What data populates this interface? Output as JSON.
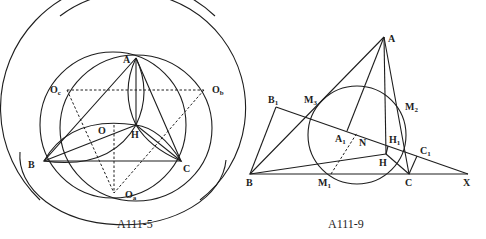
{
  "figures": [
    {
      "id": "left",
      "caption": "A111-5",
      "labels": {
        "A": "A",
        "B": "B",
        "C": "C",
        "H": "H",
        "O": "O",
        "Oa": "O",
        "Oa_sub": "a",
        "Ob": "O",
        "Ob_sub": "b",
        "Oc": "O",
        "Oc_sub": "c"
      }
    },
    {
      "id": "right",
      "caption": "A111-9",
      "labels": {
        "A": "A",
        "B": "B",
        "C": "C",
        "H": "H",
        "N": "N",
        "X": "X",
        "A1": "A",
        "A1_sub": "1",
        "B1": "B",
        "B1_sub": "1",
        "C1": "C",
        "C1_sub": "1",
        "H1": "H",
        "H1_sub": "1",
        "M1": "M",
        "M1_sub": "1",
        "M2": "M",
        "M2_sub": "2",
        "M3": "M",
        "M3_sub": "3"
      }
    }
  ]
}
